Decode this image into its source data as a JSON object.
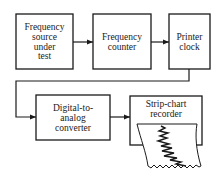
{
  "diagram": {
    "type": "block-diagram",
    "blocks": [
      {
        "id": "source",
        "lines": [
          "Frequency",
          "source",
          "under",
          "test"
        ]
      },
      {
        "id": "counter",
        "lines": [
          "Frequency",
          "counter"
        ]
      },
      {
        "id": "clock",
        "lines": [
          "Printer",
          "clock"
        ]
      },
      {
        "id": "dac",
        "lines": [
          "Digital-to-",
          "analog",
          "converter"
        ]
      },
      {
        "id": "recorder",
        "lines": [
          "Strip-chart",
          "recorder"
        ]
      }
    ],
    "connections": [
      {
        "from": "source",
        "to": "counter"
      },
      {
        "from": "counter",
        "to": "clock"
      },
      {
        "from": "clock",
        "to": "dac"
      },
      {
        "from": "dac",
        "to": "recorder"
      }
    ],
    "icons": {
      "arrow": "arrowhead-icon",
      "paper": "strip-chart-paper-icon"
    }
  }
}
